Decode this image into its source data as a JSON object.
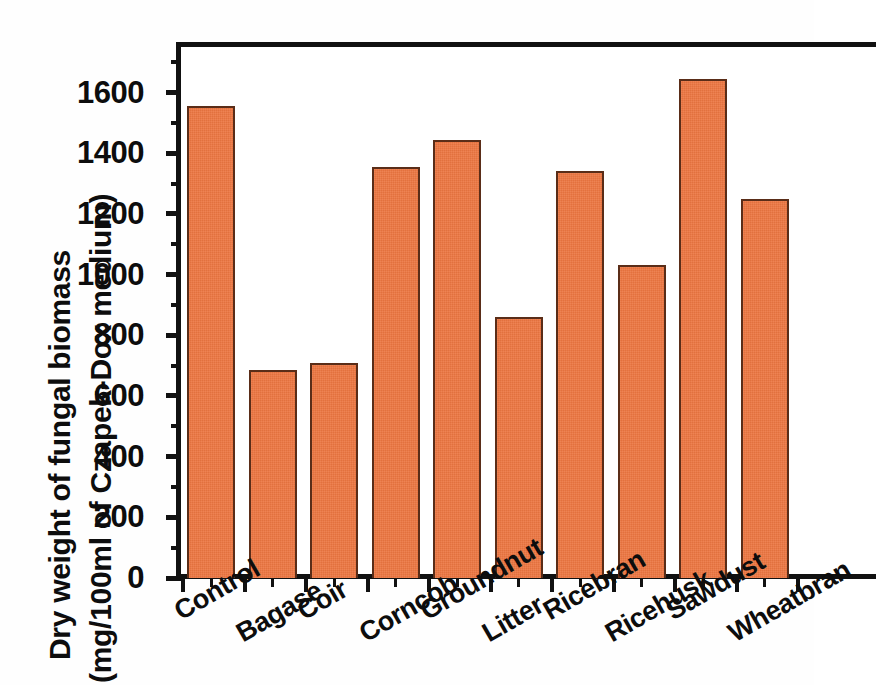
{
  "chart_data": {
    "type": "bar",
    "title": "",
    "xlabel": "",
    "ylabel": "Dry weight of fungal biomass (mg/100ml of Czapek-Dox medium)",
    "ylabel_line1": "Dry weight of fungal biomass",
    "ylabel_line2": "(mg/100ml of Czapek-Dox medium)",
    "categories": [
      "Control",
      "Bagase",
      "Coir",
      "Corncob",
      "Groundnut",
      "Litter",
      "Ricebran",
      "Ricehusk",
      "Sawdust",
      "Wheatbran"
    ],
    "values": [
      1555,
      685,
      710,
      1355,
      1445,
      860,
      1340,
      1030,
      1645,
      1250
    ],
    "ylim": [
      0,
      1750
    ],
    "y_ticks": [
      0,
      200,
      400,
      600,
      800,
      1000,
      1200,
      1400,
      1600
    ],
    "y_tick_labels": [
      "0",
      "200",
      "400",
      "600",
      "800",
      "1000",
      "1200",
      "1400",
      "1600"
    ],
    "y_minor_ticks": [
      100,
      300,
      500,
      700,
      900,
      1100,
      1300,
      1500,
      1700
    ],
    "grid": false,
    "legend": null,
    "bar_color": "#ec7540",
    "bar_edge_color": "#5a2d18",
    "axis_color": "#111111",
    "plot_background": "#ffffff",
    "series": [
      {
        "name": "Dry weight of fungal biomass",
        "values": [
          1555,
          685,
          710,
          1355,
          1445,
          860,
          1340,
          1030,
          1645,
          1250
        ]
      }
    ]
  }
}
